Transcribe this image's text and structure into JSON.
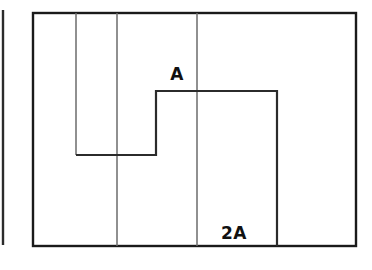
{
  "figure": {
    "canvas": {
      "width": 372,
      "height": 270,
      "background": "#ffffff"
    },
    "colors": {
      "outer_border": "#1a1a1a",
      "divider": "#6b6b6b",
      "step_path": "#2b2b2b",
      "fragment": "#2b2b2b",
      "label_text": "#111111"
    },
    "outer_rectangle": {
      "name": "outer-rectangle",
      "x": 33,
      "y": 13,
      "width": 323,
      "height": 233,
      "stroke_width": 2.4
    },
    "left_fragment": {
      "name": "left-edge-fragment",
      "x": 3,
      "y1": 10,
      "y2": 245,
      "stroke_width": 2.4
    },
    "dividers": [
      {
        "name": "divider-1",
        "x": 76,
        "y1": 13,
        "y2": 155,
        "stroke_width": 1.5
      },
      {
        "name": "divider-2",
        "x": 117,
        "y1": 13,
        "y2": 246,
        "stroke_width": 1.5
      },
      {
        "name": "divider-3",
        "x": 197,
        "y1": 13,
        "y2": 246,
        "stroke_width": 1.5
      }
    ],
    "step_path": {
      "name": "step-boundary",
      "points": "76,155 156,155 156,91 277,91 277,246",
      "stroke_width": 2.2
    },
    "labels": [
      {
        "name": "label-a",
        "text": "A",
        "x": 177,
        "y": 80,
        "anchor": "middle"
      },
      {
        "name": "label-2a",
        "text": "2A",
        "x": 234,
        "y": 239,
        "anchor": "middle"
      }
    ]
  }
}
